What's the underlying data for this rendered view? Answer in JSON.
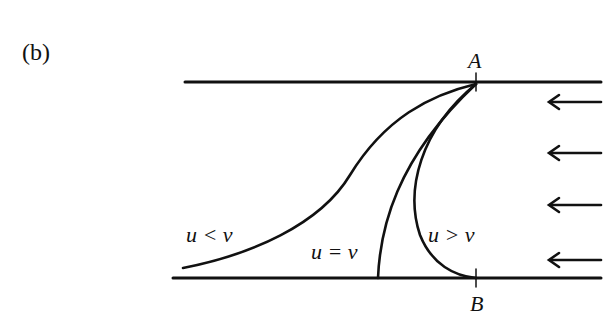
{
  "figure": {
    "panel_label": "(b)",
    "points": {
      "top": "A",
      "bottom": "B"
    },
    "curves": [
      {
        "id": "u_less_v",
        "label": "u < v"
      },
      {
        "id": "u_equal_v",
        "label": "u = v"
      },
      {
        "id": "u_greater_v",
        "label": "u > v"
      }
    ],
    "flow_arrows": {
      "count": 5,
      "direction": "left"
    },
    "colors": {
      "ink": "#111111",
      "background": "#ffffff"
    }
  }
}
